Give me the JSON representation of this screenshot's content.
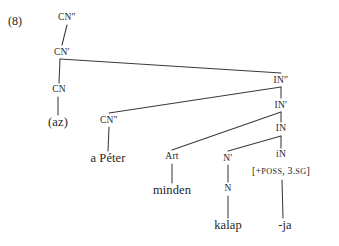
{
  "figure": {
    "example_number": "(8)",
    "type": "syntax-tree",
    "language_example": "(az) a Péter minden kalap-ja",
    "line_color": "#3a3a3a",
    "text_color": "#262626",
    "background_color": "#ffffff"
  },
  "nodes": [
    {
      "id": "cn2_top",
      "label": "CN″",
      "kind": "category",
      "x": 67,
      "y": 17
    },
    {
      "id": "cn1",
      "label": "CN′",
      "kind": "category",
      "x": 62,
      "y": 52
    },
    {
      "id": "cn0",
      "label": "CN",
      "kind": "category",
      "x": 59,
      "y": 90
    },
    {
      "id": "az",
      "label": "(az)",
      "kind": "terminal",
      "x": 58,
      "y": 122
    },
    {
      "id": "cn2_spec",
      "label": "CN″",
      "kind": "category",
      "x": 109,
      "y": 120
    },
    {
      "id": "apeter",
      "label": "a Péter",
      "kind": "terminal",
      "x": 108,
      "y": 158
    },
    {
      "id": "art",
      "label": "Art",
      "kind": "category",
      "x": 172,
      "y": 157
    },
    {
      "id": "minden",
      "label": "minden",
      "kind": "terminal",
      "x": 172,
      "y": 190
    },
    {
      "id": "in2",
      "label": "IN″",
      "kind": "category",
      "x": 281,
      "y": 80
    },
    {
      "id": "in1",
      "label": "IN′",
      "kind": "category",
      "x": 281,
      "y": 105
    },
    {
      "id": "in0",
      "label": "IN",
      "kind": "category",
      "x": 281,
      "y": 129
    },
    {
      "id": "n1",
      "label": "N′",
      "kind": "category",
      "x": 228,
      "y": 158
    },
    {
      "id": "in_small",
      "label": "iN",
      "kind": "category",
      "x": 281,
      "y": 155
    },
    {
      "id": "feat",
      "label": "[+POSS, 3.SG]",
      "kind": "feature",
      "x": 281,
      "y": 171
    },
    {
      "id": "n0",
      "label": "N",
      "kind": "category",
      "x": 228,
      "y": 189
    },
    {
      "id": "kalap",
      "label": "kalap",
      "kind": "terminal",
      "x": 228,
      "y": 225
    },
    {
      "id": "ja",
      "label": "-ja",
      "kind": "terminal",
      "x": 285,
      "y": 225
    }
  ],
  "branches": [
    {
      "from": "cn2_top",
      "to": "cn1",
      "x1": 67,
      "y1": 25,
      "x2": 62,
      "y2": 45
    },
    {
      "from": "cn1",
      "to": "cn0",
      "x1": 60,
      "y1": 59,
      "x2": 59,
      "y2": 83
    },
    {
      "from": "cn1",
      "to": "in2",
      "x1": 60,
      "y1": 59,
      "x2": 281,
      "y2": 73
    },
    {
      "from": "cn0",
      "to": "az",
      "x1": 58,
      "y1": 97,
      "x2": 58,
      "y2": 115
    },
    {
      "from": "in2",
      "to": "cn2_spec",
      "x1": 281,
      "y1": 87,
      "x2": 109,
      "y2": 113
    },
    {
      "from": "in2",
      "to": "in1",
      "x1": 281,
      "y1": 87,
      "x2": 281,
      "y2": 98
    },
    {
      "from": "cn2_spec",
      "to": "apeter",
      "x1": 109,
      "y1": 127,
      "x2": 108,
      "y2": 151
    },
    {
      "from": "in1",
      "to": "art",
      "x1": 281,
      "y1": 112,
      "x2": 172,
      "y2": 150
    },
    {
      "from": "in1",
      "to": "in0",
      "x1": 281,
      "y1": 112,
      "x2": 281,
      "y2": 122
    },
    {
      "from": "art",
      "to": "minden",
      "x1": 172,
      "y1": 164,
      "x2": 172,
      "y2": 183
    },
    {
      "from": "in0",
      "to": "n1",
      "x1": 281,
      "y1": 136,
      "x2": 228,
      "y2": 151
    },
    {
      "from": "in0",
      "to": "in_small",
      "x1": 281,
      "y1": 136,
      "x2": 281,
      "y2": 148
    },
    {
      "from": "n1",
      "to": "n0",
      "x1": 228,
      "y1": 165,
      "x2": 228,
      "y2": 182
    },
    {
      "from": "feat",
      "to": "ja",
      "x1": 282,
      "y1": 180,
      "x2": 283,
      "y2": 218
    },
    {
      "from": "n0",
      "to": "kalap",
      "x1": 228,
      "y1": 196,
      "x2": 228,
      "y2": 218
    }
  ]
}
